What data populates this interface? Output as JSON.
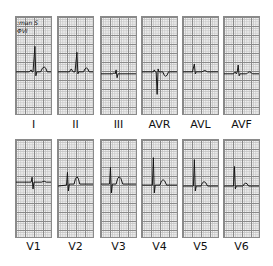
{
  "figure": {
    "type": "12-lead ECG",
    "handwritten_note": [
      ":man S",
      "ΦVI"
    ],
    "rows": [
      {
        "leads": [
          {
            "label": "I",
            "x": 15,
            "trace": "M0 56 L14 56 L16 54 L17 56 L18 56 L20 30 L21 60 L22 56 L26 56 Q30 46 33 56 L37 56"
          },
          {
            "label": "II",
            "x": 57,
            "trace": "M0 56 L12 56 L14 53 L16 56 L18 56 L20 36 L21 58 L22 56 L27 56 Q30 48 33 56 L37 56"
          },
          {
            "label": "III",
            "x": 100,
            "trace": "M0 58 L12 58 L14 57 L15 58 L16 54 L17 62 L18 58 L37 58"
          },
          {
            "label": "AVR",
            "x": 141,
            "trace": "M0 56 L12 56 L13 54 L14 56 L15 56 L16 79 L17 53 L18 56 L22 56 Q25 65 28 56 L37 56"
          },
          {
            "label": "AVL",
            "x": 182,
            "trace": "M0 56 L10 56 L12 48 L13 58 L14 56 L20 56 Q23 53 26 56 L37 56"
          },
          {
            "label": "AVF",
            "x": 223,
            "trace": "M0 58 L10 58 L12 56 L13 58 L14 56 L15 49 L16 60 L17 58 L24 58 Q27 54 30 58 L37 58"
          }
        ],
        "top": 16,
        "label_top": 118
      },
      {
        "leads": [
          {
            "label": "V1",
            "x": 15,
            "trace": "M0 43 L16 43 L17 38 L18 50 L19 43 L27 43 Q30 41 32 43 L37 43"
          },
          {
            "label": "V2",
            "x": 57,
            "trace": "M0 47 L9 46 L10 33 L11 52 L12 45 L17 45 Q20 30 23 45 L37 45"
          },
          {
            "label": "V3",
            "x": 100,
            "trace": "M0 45 L9 45 L10 28 L11 54 L12 45 L16 45 Q19 30 23 45 L37 45"
          },
          {
            "label": "V4",
            "x": 141,
            "trace": "M0 46 L11 46 L12 18 L13 54 L14 46 L19 46 Q22 35 26 46 L37 46"
          },
          {
            "label": "V5",
            "x": 182,
            "trace": "M0 47 L11 47 L12 20 L13 52 L14 47 L19 47 Q22 38 26 47 L37 47"
          },
          {
            "label": "V6",
            "x": 223,
            "trace": "M0 47 L10 47 L11 27 L12 50 L13 47 L20 47 Q23 41 26 47 L37 47"
          }
        ],
        "top": 139,
        "label_top": 240
      }
    ]
  }
}
